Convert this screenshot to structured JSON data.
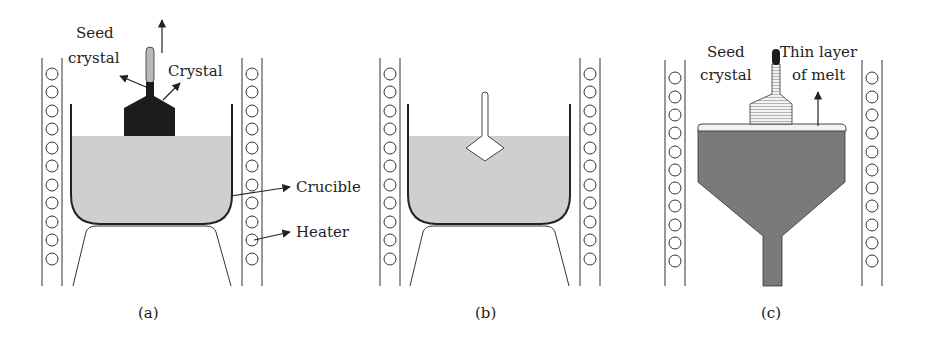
{
  "figure": {
    "panels": [
      {
        "id": "a",
        "caption": "(a)",
        "labels": {
          "seed_crystal_line1": "Seed",
          "seed_crystal_line2": "crystal",
          "crystal": "Crystal",
          "crucible": "Crucible",
          "heater": "Heater"
        }
      },
      {
        "id": "b",
        "caption": "(b)"
      },
      {
        "id": "c",
        "caption": "(c)",
        "labels": {
          "seed_crystal_line1": "Seed",
          "seed_crystal_line2": "crystal",
          "thin_layer_line1": "Thin layer",
          "thin_layer_line2": "of melt"
        }
      }
    ],
    "colors": {
      "melt": "#cfcfcf",
      "crystal_dark": "#1c1c1c",
      "crystal_grown_c": "#7a7a7a",
      "seed_rod": "#b9b9b9",
      "line": "#2a2a2a"
    }
  }
}
